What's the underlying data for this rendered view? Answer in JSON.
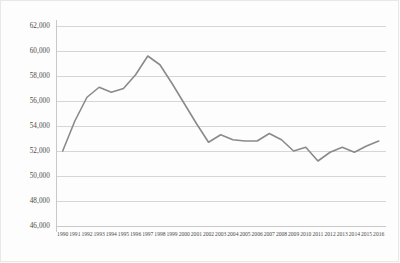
{
  "chart_data": {
    "type": "line",
    "title": "",
    "subtitle": "",
    "xlabel": "",
    "ylabel": "",
    "grid": true,
    "legend": "none",
    "ylim": [
      46000,
      62000
    ],
    "ytick_step": 2000,
    "ytick_labels": [
      "62,000",
      "60,000",
      "58,000",
      "56,000",
      "54,000",
      "52,000",
      "50,000",
      "48,000",
      "46,000"
    ],
    "ytick_values": [
      62000,
      60000,
      58000,
      56000,
      54000,
      52000,
      50000,
      48000,
      46000
    ],
    "categories": [
      "1990",
      "1991",
      "1992",
      "1993",
      "1994",
      "1995",
      "1996",
      "1997",
      "1998",
      "1999",
      "2000",
      "2001",
      "2002",
      "2003",
      "2004",
      "2005",
      "2006",
      "2007",
      "2008",
      "2009",
      "2010",
      "2011",
      "2012",
      "2013",
      "2014",
      "2015",
      "2016"
    ],
    "x": [
      1990,
      1991,
      1992,
      1993,
      1994,
      1995,
      1996,
      1997,
      1998,
      1999,
      2000,
      2001,
      2002,
      2003,
      2004,
      2005,
      2006,
      2007,
      2008,
      2009,
      2010,
      2011,
      2012,
      2013,
      2014,
      2015,
      2016
    ],
    "values": [
      52000,
      54400,
      56300,
      57100,
      56700,
      57000,
      58100,
      59600,
      58900,
      57400,
      55800,
      54200,
      52700,
      53300,
      52900,
      52800,
      52800,
      53400,
      52900,
      52000,
      52300,
      51200,
      51900,
      52300,
      51900,
      52400,
      52800
    ],
    "series": [
      {
        "name": "",
        "color": "#8a8a8a",
        "values": [
          52000,
          54400,
          56300,
          57100,
          56700,
          57000,
          58100,
          59600,
          58900,
          57400,
          55800,
          54200,
          52700,
          53300,
          52900,
          52800,
          52800,
          53400,
          52900,
          52000,
          52300,
          51200,
          51900,
          52300,
          51900,
          52400,
          52800
        ]
      }
    ]
  },
  "style": {
    "background_color": "#fdfdfd",
    "grid_color": "#d6d6d6",
    "axis_color": "#c9c9c9",
    "line_color": "#8a8a8a",
    "tick_label_color": "#4a4a4a"
  }
}
